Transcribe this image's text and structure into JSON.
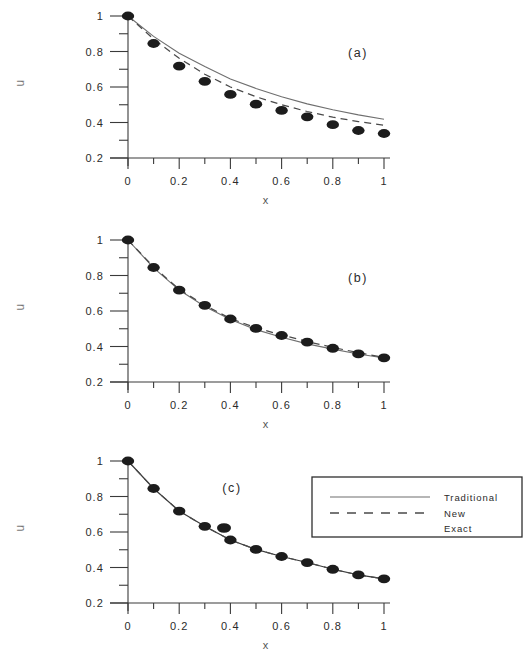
{
  "figure": {
    "background": "#ffffff",
    "ink_color": "#1c1c1c"
  },
  "axis": {
    "x_title": "x",
    "y_title": "u",
    "x_ticklabels": [
      "0",
      "0.2",
      "0.4",
      "0.6",
      "0.8",
      "1"
    ],
    "y_ticklabels": [
      "1",
      "0.8",
      "0.6",
      "0.4",
      "0.2"
    ]
  },
  "legend": {
    "position": "panel-c-upper-right",
    "entries": [
      {
        "label": "Traditional",
        "marker": "solid-line",
        "color": "#6f6f6f"
      },
      {
        "label": "New",
        "marker": "dashed-line",
        "color": "#4a4a4a"
      },
      {
        "label": "Exact",
        "marker": "filled-circle",
        "color": "#1c1c1c"
      }
    ]
  },
  "panels": [
    {
      "id": "a",
      "label": "(a)"
    },
    {
      "id": "b",
      "label": "(b)"
    },
    {
      "id": "c",
      "label": "(c)"
    }
  ],
  "chart_data": [
    {
      "type": "line",
      "panel": "a",
      "title": "(a)",
      "xlabel": "x",
      "ylabel": "u",
      "xlim": [
        0,
        1
      ],
      "ylim": [
        0.2,
        1
      ],
      "xticks": [
        0,
        0.1,
        0.2,
        0.3,
        0.4,
        0.5,
        0.6,
        0.7,
        0.8,
        0.9,
        1
      ],
      "yticks": [
        0.2,
        0.3,
        0.4,
        0.5,
        0.6,
        0.7,
        0.8,
        0.9,
        1
      ],
      "grid": false,
      "x": [
        0,
        0.1,
        0.2,
        0.3,
        0.4,
        0.5,
        0.6,
        0.7,
        0.8,
        0.9,
        1
      ],
      "series": [
        {
          "name": "Traditional",
          "style": "solid",
          "values": [
            1.0,
            0.885,
            0.79,
            0.715,
            0.645,
            0.592,
            0.545,
            0.505,
            0.472,
            0.443,
            0.418
          ]
        },
        {
          "name": "New",
          "style": "dashed",
          "values": [
            1.0,
            0.87,
            0.762,
            0.672,
            0.6,
            0.545,
            0.5,
            0.462,
            0.43,
            0.405,
            0.385
          ]
        },
        {
          "name": "Exact",
          "style": "points",
          "values": [
            1.0,
            0.845,
            0.718,
            0.632,
            0.558,
            0.503,
            0.468,
            0.432,
            0.388,
            0.355,
            0.338
          ]
        }
      ]
    },
    {
      "type": "line",
      "panel": "b",
      "title": "(b)",
      "xlabel": "x",
      "ylabel": "u",
      "xlim": [
        0,
        1
      ],
      "ylim": [
        0.2,
        1
      ],
      "xticks": [
        0,
        0.1,
        0.2,
        0.3,
        0.4,
        0.5,
        0.6,
        0.7,
        0.8,
        0.9,
        1
      ],
      "yticks": [
        0.2,
        0.3,
        0.4,
        0.5,
        0.6,
        0.7,
        0.8,
        0.9,
        1
      ],
      "grid": false,
      "x": [
        0,
        0.1,
        0.2,
        0.3,
        0.4,
        0.5,
        0.6,
        0.7,
        0.8,
        0.9,
        1
      ],
      "series": [
        {
          "name": "Traditional",
          "style": "solid",
          "values": [
            1.0,
            0.843,
            0.718,
            0.625,
            0.552,
            0.495,
            0.452,
            0.415,
            0.385,
            0.358,
            0.335
          ]
        },
        {
          "name": "New",
          "style": "dashed",
          "values": [
            1.0,
            0.848,
            0.722,
            0.632,
            0.558,
            0.505,
            0.465,
            0.428,
            0.395,
            0.365,
            0.338
          ]
        },
        {
          "name": "Exact",
          "style": "points",
          "values": [
            1.0,
            0.845,
            0.718,
            0.632,
            0.555,
            0.502,
            0.462,
            0.425,
            0.39,
            0.358,
            0.336
          ]
        }
      ]
    },
    {
      "type": "line",
      "panel": "c",
      "title": "(c)",
      "xlabel": "x",
      "ylabel": "u",
      "xlim": [
        0,
        1
      ],
      "ylim": [
        0.2,
        1
      ],
      "xticks": [
        0,
        0.1,
        0.2,
        0.3,
        0.4,
        0.5,
        0.6,
        0.7,
        0.8,
        0.9,
        1
      ],
      "yticks": [
        0.2,
        0.3,
        0.4,
        0.5,
        0.6,
        0.7,
        0.8,
        0.9,
        1
      ],
      "grid": false,
      "x": [
        0,
        0.1,
        0.2,
        0.3,
        0.4,
        0.5,
        0.6,
        0.7,
        0.8,
        0.9,
        1
      ],
      "series": [
        {
          "name": "Traditional",
          "style": "solid",
          "values": [
            1.0,
            0.845,
            0.718,
            0.632,
            0.555,
            0.502,
            0.462,
            0.428,
            0.39,
            0.358,
            0.336
          ]
        },
        {
          "name": "New",
          "style": "dashed",
          "values": [
            1.0,
            0.845,
            0.718,
            0.632,
            0.555,
            0.502,
            0.462,
            0.428,
            0.39,
            0.358,
            0.336
          ]
        },
        {
          "name": "Exact",
          "style": "points",
          "values": [
            1.0,
            0.845,
            0.718,
            0.632,
            0.555,
            0.502,
            0.462,
            0.428,
            0.39,
            0.358,
            0.336
          ]
        }
      ]
    }
  ]
}
